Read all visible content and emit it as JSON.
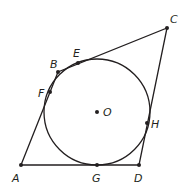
{
  "diagram": {
    "type": "quadrilateral-circumscribed-about-circle",
    "colors": {
      "stroke": "#231f20",
      "background": "#ffffff"
    },
    "circle": {
      "center_label": "O",
      "cx": 97,
      "cy": 112,
      "r": 53
    },
    "vertices": [
      {
        "label": "A",
        "x": 21,
        "y": 165,
        "lx": 12,
        "ly": 182
      },
      {
        "label": "B",
        "x": 58,
        "y": 72,
        "lx": 50,
        "ly": 68
      },
      {
        "label": "C",
        "x": 167,
        "y": 28,
        "lx": 170,
        "ly": 23
      },
      {
        "label": "D",
        "x": 139,
        "y": 165,
        "lx": 134,
        "ly": 182
      }
    ],
    "tangent_points": [
      {
        "label": "E",
        "x": 78,
        "y": 63,
        "lx": 73,
        "ly": 57
      },
      {
        "label": "F",
        "x": 50,
        "y": 92,
        "lx": 38,
        "ly": 97
      },
      {
        "label": "G",
        "x": 97,
        "y": 165,
        "lx": 92,
        "ly": 182
      },
      {
        "label": "H",
        "x": 147,
        "y": 123,
        "lx": 151,
        "ly": 128
      }
    ],
    "center": {
      "label": "O",
      "x": 97,
      "y": 112,
      "lx": 103,
      "ly": 116
    },
    "sides": [
      "AB",
      "BC",
      "CD",
      "DA"
    ]
  }
}
